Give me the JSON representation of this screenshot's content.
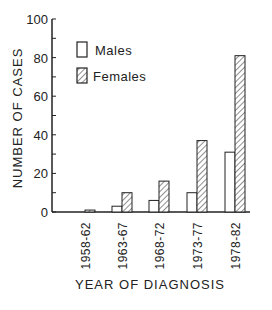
{
  "chart_data": {
    "type": "bar",
    "title": "",
    "xlabel": "YEAR OF DIAGNOSIS",
    "ylabel": "NUMBER OF CASES",
    "ylim": [
      0,
      100
    ],
    "yticks": [
      0,
      20,
      40,
      60,
      80,
      100
    ],
    "grid": false,
    "legend_position": "upper-left-inside",
    "categories": [
      "1958-62",
      "1963-67",
      "1968-72",
      "1973-77",
      "1978-82"
    ],
    "series": [
      {
        "name": "Males",
        "pattern": "open",
        "values": [
          0,
          3,
          6,
          10,
          31
        ]
      },
      {
        "name": "Females",
        "pattern": "hatched",
        "values": [
          1,
          10,
          16,
          37,
          81
        ]
      }
    ]
  },
  "colors": {
    "ink": "#222222",
    "background": "#ffffff"
  }
}
